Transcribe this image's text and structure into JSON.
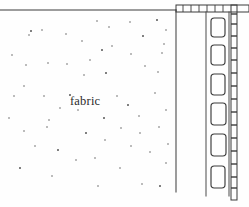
{
  "figure": {
    "kind": "technical-line-drawing",
    "background_color": "#fefefe",
    "ink_color": "#3a3a3a",
    "width": 249,
    "height": 207,
    "labels": [
      {
        "name": "fabric-label",
        "text": "fabric",
        "x": 70,
        "y": 94
      }
    ],
    "chart_data": {
      "type": "scatter",
      "title": "",
      "xlabel": "",
      "ylabel": "",
      "xlim": [
        0,
        249
      ],
      "ylim": [
        0,
        207
      ],
      "grid": false,
      "legend": null,
      "series": [
        {
          "name": "fabric-stipple-dots",
          "marker": "dot",
          "color": "#4a4a4a",
          "points": [
            [
              31,
              31
            ],
            [
              66,
              34
            ],
            [
              97,
              21
            ],
            [
              109,
              27
            ],
            [
              130,
              22
            ],
            [
              157,
              20
            ],
            [
              29,
              35
            ],
            [
              42,
              30
            ],
            [
              82,
              41
            ],
            [
              112,
              46
            ],
            [
              143,
              36
            ],
            [
              166,
              30
            ],
            [
              26,
              65
            ],
            [
              48,
              63
            ],
            [
              67,
              64
            ],
            [
              102,
              50
            ],
            [
              131,
              54
            ],
            [
              162,
              53
            ],
            [
              24,
              86
            ],
            [
              84,
              75
            ],
            [
              106,
              73
            ],
            [
              145,
              66
            ],
            [
              164,
              44
            ],
            [
              158,
              72
            ],
            [
              14,
              96
            ],
            [
              70,
              95
            ],
            [
              117,
              96
            ],
            [
              155,
              93
            ],
            [
              49,
              120
            ],
            [
              78,
              110
            ],
            [
              104,
              118
            ],
            [
              139,
              116
            ],
            [
              166,
              110
            ],
            [
              24,
              131
            ],
            [
              47,
              127
            ],
            [
              86,
              133
            ],
            [
              121,
              128
            ],
            [
              140,
              133
            ],
            [
              159,
              127
            ],
            [
              35,
              146
            ],
            [
              58,
              150
            ],
            [
              95,
              158
            ],
            [
              131,
              146
            ],
            [
              150,
              152
            ],
            [
              168,
              144
            ],
            [
              20,
              168
            ],
            [
              52,
              176
            ],
            [
              98,
              186
            ],
            [
              120,
              168
            ],
            [
              142,
              184
            ],
            [
              160,
              186
            ],
            [
              166,
              163
            ],
            [
              9,
              118
            ],
            [
              90,
              60
            ],
            [
              60,
              108
            ],
            [
              128,
              105
            ],
            [
              105,
              140
            ],
            [
              76,
              160
            ],
            [
              44,
              96
            ],
            [
              12,
              55
            ]
          ]
        }
      ]
    },
    "elements": [
      {
        "name": "top-boundary-line",
        "type": "line",
        "x1": 0,
        "y1": 10,
        "x2": 176,
        "y2": 10
      },
      {
        "name": "inner-vertical-edge-line",
        "type": "line",
        "x1": 176,
        "y1": 10,
        "x2": 176,
        "y2": 192
      },
      {
        "name": "frame-outer-top-band",
        "type": "band",
        "x": 176,
        "y": 5,
        "width": 73,
        "height": 7
      },
      {
        "name": "frame-right-rail",
        "type": "band",
        "x": 231,
        "y": 5,
        "width": 6,
        "height": 195
      },
      {
        "name": "slot-column-left-line",
        "type": "line",
        "x1": 206,
        "y1": 12,
        "x2": 206,
        "y2": 196
      },
      {
        "name": "slot-column-right-line",
        "type": "line",
        "x1": 229,
        "y1": 12,
        "x2": 229,
        "y2": 196
      },
      {
        "name": "slot-opening-1",
        "type": "rounded-rect",
        "x": 211,
        "y": 18,
        "width": 14,
        "height": 19
      },
      {
        "name": "slot-opening-2",
        "type": "rounded-rect",
        "x": 211,
        "y": 45,
        "width": 14,
        "height": 20
      },
      {
        "name": "slot-opening-3",
        "type": "rounded-rect",
        "x": 211,
        "y": 74,
        "width": 14,
        "height": 21
      },
      {
        "name": "slot-opening-4",
        "type": "rounded-rect",
        "x": 211,
        "y": 103,
        "width": 15,
        "height": 22
      },
      {
        "name": "slot-opening-5",
        "type": "rounded-rect",
        "x": 211,
        "y": 134,
        "width": 15,
        "height": 22
      },
      {
        "name": "slot-opening-6",
        "type": "rounded-rect",
        "x": 211,
        "y": 166,
        "width": 14,
        "height": 22
      }
    ],
    "tick_marks": {
      "top_band_ticks_x": [
        183,
        191,
        199,
        207,
        215,
        223
      ],
      "right_rail_ticks_y": [
        14,
        24,
        36,
        48,
        60,
        73,
        86,
        99,
        112,
        125,
        138,
        151,
        164,
        177,
        188
      ]
    }
  }
}
